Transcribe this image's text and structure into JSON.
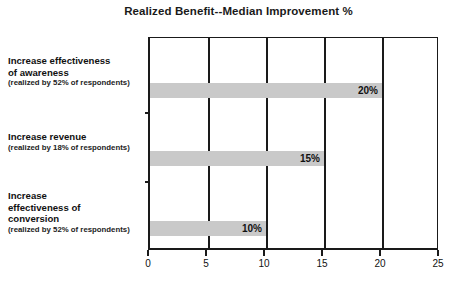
{
  "chart_data": {
    "type": "bar",
    "orientation": "horizontal",
    "title": "Realized Benefit--Median Improvement %",
    "xlabel": "",
    "ylabel": "",
    "xlim": [
      0,
      25
    ],
    "xticks": [
      "0",
      "5",
      "10",
      "15",
      "20",
      "25"
    ],
    "grid": true,
    "legend": false,
    "bar_color": "#c9c9c9",
    "categories": [
      "Increase effectiveness of awareness",
      "Increase revenue",
      "Increase effectiveness of conversion"
    ],
    "values": [
      20,
      15,
      10
    ],
    "data_labels": [
      "20%",
      "15%",
      "10%"
    ],
    "category_labels": [
      {
        "main": "Increase effectiveness\nof awareness",
        "sub": "(realized by 52% of respondents)"
      },
      {
        "main": "Increase revenue",
        "sub": "(realized by 18% of respondents)"
      },
      {
        "main": "Increase\neffectiveness of\nconversion",
        "sub": "(realized by 52% of respondents)"
      }
    ]
  }
}
